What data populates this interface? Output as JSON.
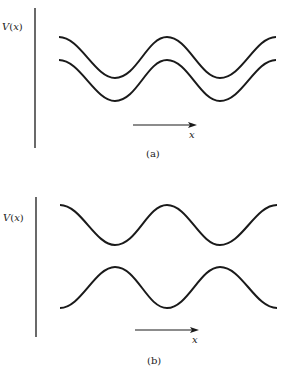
{
  "panels": [
    {
      "id": "a",
      "ylabel": "V(x)",
      "xlabel": "x",
      "caption": "(a)",
      "description": "Two identical periodic potential curves, vertically offset, in phase"
    },
    {
      "id": "b",
      "ylabel": "V(x)",
      "xlabel": "x",
      "caption": "(b)",
      "description": "Two periodic potential curves, vertically offset, half a period out of phase"
    }
  ],
  "colors": {
    "line": "#1a1a1a",
    "background": "#ffffff"
  }
}
